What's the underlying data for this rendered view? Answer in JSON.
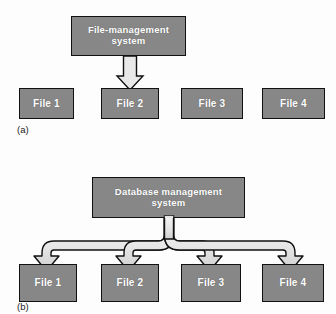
{
  "figure": {
    "background_color": "#fdfdfd",
    "box_fill_color": "#878787",
    "box_border_color": "#111111",
    "box_text_color": "#ffffff",
    "arrow_fill_color": "#e8e8e8",
    "arrow_border_color": "#111111"
  },
  "panel_a": {
    "caption": "(a)",
    "header_box": {
      "label_line1": "File-management",
      "label_line2": "system"
    },
    "files": [
      {
        "label": "File 1",
        "has_arrow": false
      },
      {
        "label": "File 2",
        "has_arrow": true
      },
      {
        "label": "File 3",
        "has_arrow": false
      },
      {
        "label": "File 4",
        "has_arrow": false
      }
    ],
    "arrow_count": 1
  },
  "panel_b": {
    "caption": "(b)",
    "header_box": {
      "label_line1": "Database management",
      "label_line2": "system"
    },
    "files": [
      {
        "label": "File 1",
        "has_arrow": true
      },
      {
        "label": "File 2",
        "has_arrow": true
      },
      {
        "label": "File 3",
        "has_arrow": true
      },
      {
        "label": "File 4",
        "has_arrow": true
      }
    ],
    "arrow_count": 4
  }
}
